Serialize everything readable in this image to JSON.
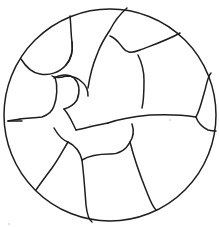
{
  "figure": {
    "background_color": "#ffffff",
    "line_color": "#1e1e1e",
    "outline": {
      "shape": "circle",
      "cx": 110,
      "cy": 115,
      "r": 106
    },
    "cell_boundaries": [
      "M70,16 C71,25 71,36 72,42 C73,50 72,58 66,65 C60,72 50,76 40,74 C32,73 26,67 21,59",
      "M72,42 C73,50 72,58 66,65",
      "M52,76 C55,78 60,78 66,76 C72,76 78,78 82,82 C87,86 88,90 88,96",
      "M127,8 C120,14 114,22 110,30 C106,36 101,44 98,52 C96,58 92,63 88,88",
      "M110,36 C116,38 119,43 123,48 C126,52 130,54 140,50 C150,46 168,40 180,33",
      "M138,55 C142,63 144,70 144,80 C144,90 144,100 142,108",
      "M55,77 C58,86 57,98 54,106 C52,112 48,115 42,117 C33,118 26,118 20,119",
      "M20,119 C16,120 12,120 8,121",
      "M54,78 C59,75 68,73 74,78 C80,84 80,92 77,100 C73,106 68,108 64,109",
      "M64,109 C70,116 72,122 76,130",
      "M76,130 C86,128 96,125 108,123",
      "M108,123 C116,120 130,117 150,115 C170,114 184,115 196,117",
      "M196,117 C200,110 202,100 205,90 C207,82 208,76 211,73",
      "M196,117 C198,123 202,127 208,130 C212,131 214,131 216,131",
      "M54,128 C58,135 62,140 68,142 C76,146 80,152 82,160",
      "M82,160 C90,155 100,154 110,154 C120,154 126,150 130,142 C134,136 134,130 132,124",
      "M82,160 C84,176 85,192 86,205 C87,214 89,220 92,222",
      "M130,142 C134,158 140,175 146,190 C150,200 152,206 156,210",
      "M68,142 C62,152 58,160 52,168 C46,176 40,184 36,190",
      "M8,121 C12,121 18,121 22,121"
    ],
    "specks": [
      {
        "x": 90,
        "y": 125
      },
      {
        "x": 170,
        "y": 120
      },
      {
        "x": 9,
        "y": 224
      }
    ]
  }
}
